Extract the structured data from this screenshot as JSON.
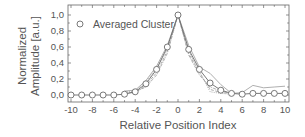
{
  "chart_data": {
    "type": "line",
    "title": "",
    "xlabel": "Relative Position Index",
    "ylabel_lines": [
      "Normalized",
      "Amplitude [a.u.]"
    ],
    "ylabel": "Normalized Amplitude [a.u.]",
    "xlim": [
      -10.3,
      10.3
    ],
    "ylim": [
      -0.08,
      1.1
    ],
    "x_ticks": [
      -10,
      -8,
      -6,
      -4,
      -2,
      0,
      2,
      4,
      6,
      8,
      10
    ],
    "x_tick_labels": [
      "-10",
      "-8",
      "-6",
      "-4",
      "-2",
      "0",
      "2",
      "4",
      "6",
      "8",
      "10"
    ],
    "y_ticks": [
      0.0,
      0.2,
      0.4,
      0.6,
      0.8,
      1.0
    ],
    "y_tick_labels": [
      "0,0",
      "0,2",
      "0,4",
      "0,6",
      "0,8",
      "1,0"
    ],
    "grid": false,
    "legend": {
      "position": "upper-left",
      "entries": [
        "Averaged Cluster"
      ]
    },
    "x": [
      -10,
      -9,
      -8,
      -7,
      -6,
      -5,
      -4,
      -3,
      -2,
      -1,
      0,
      1,
      2,
      3,
      4,
      5,
      6,
      7,
      8,
      9,
      10
    ],
    "series": [
      {
        "name": "Averaged Cluster",
        "style": "line-circle",
        "values": [
          0.0,
          0.0,
          0.0,
          0.0,
          0.0,
          0.01,
          0.04,
          0.14,
          0.32,
          0.6,
          1.0,
          0.57,
          0.32,
          0.15,
          0.06,
          0.02,
          0.01,
          0.02,
          0.02,
          0.02,
          0.02
        ]
      },
      {
        "name": "Individual cluster 1",
        "style": "solid-gray",
        "x": [
          -5,
          -4,
          -3,
          -2,
          -1,
          0,
          1,
          2,
          3,
          4,
          5,
          6,
          7,
          8,
          9,
          10
        ],
        "values": [
          0.05,
          0.06,
          0.18,
          0.36,
          0.62,
          1.0,
          0.62,
          0.35,
          0.27,
          0.13,
          0.02,
          0.03,
          0.12,
          0.09,
          0.1,
          0.11
        ]
      },
      {
        "name": "Individual cluster 2",
        "style": "dashed-gray",
        "x": [
          -5,
          -4,
          -3,
          -2,
          -1,
          0,
          1,
          2,
          3,
          4,
          5
        ],
        "values": [
          0.03,
          0.03,
          0.12,
          0.28,
          0.55,
          1.0,
          0.52,
          0.28,
          0.07,
          0.03,
          0.02
        ]
      },
      {
        "name": "Individual cluster 3",
        "style": "dotted-gray",
        "x": [
          -5,
          -4,
          -3,
          -2,
          -1,
          0,
          1,
          2,
          3,
          4,
          5
        ],
        "values": [
          0.04,
          0.05,
          0.16,
          0.34,
          0.58,
          1.0,
          0.55,
          0.3,
          0.04,
          0.02,
          0.01
        ]
      },
      {
        "name": "Individual cluster 4",
        "style": "dashdot-gray",
        "x": [
          -5,
          -4,
          -3,
          -2,
          -1,
          0,
          1,
          2,
          3,
          4,
          5
        ],
        "values": [
          0.02,
          0.04,
          0.1,
          0.25,
          0.52,
          1.0,
          0.5,
          0.25,
          0.1,
          0.05,
          0.02
        ]
      }
    ]
  },
  "colors": {
    "axis": "#666666",
    "marker": "#6a6a6a",
    "lines": "#9a9a9a",
    "text": "#555555"
  }
}
